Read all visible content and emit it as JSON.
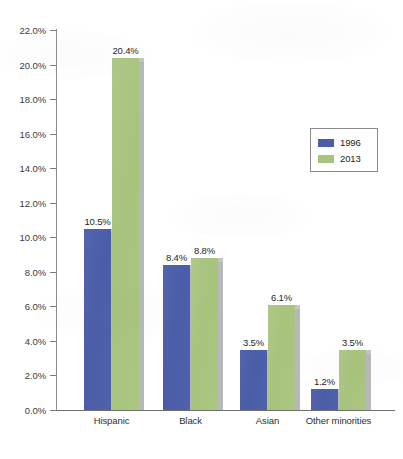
{
  "chart_data": {
    "type": "bar",
    "title": "",
    "subtitle": "",
    "xlabel": "",
    "ylabel": "",
    "categories": [
      "Hispanic",
      "Black",
      "Asian",
      "Other minorities"
    ],
    "series": [
      {
        "name": "1996",
        "color": "#4b5da8",
        "values": [
          10.5,
          8.4,
          3.5,
          1.2
        ],
        "value_labels": [
          "10.5%",
          "8.4%",
          "3.5%",
          "1.2%"
        ]
      },
      {
        "name": "2013",
        "color": "#a7c37c",
        "values": [
          20.4,
          8.8,
          6.1,
          3.5
        ],
        "value_labels": [
          "20.4%",
          "8.8%",
          "6.1%",
          "3.5%"
        ]
      }
    ],
    "ylim": [
      0.0,
      22.0
    ],
    "ytick_step": 2.0,
    "ytick_values": [
      22.0,
      20.0,
      18.0,
      16.0,
      14.0,
      12.0,
      10.0,
      8.0,
      6.0,
      4.0,
      2.0,
      0.0
    ],
    "ytick_labels": [
      "22.0%",
      "20.0%",
      "18.0%",
      "16.0%",
      "14.0%",
      "12.0%",
      "10.0%",
      "8.0%",
      "6.0%",
      "4.0%",
      "2.0%",
      "0.0%"
    ],
    "grid": false,
    "legend_position": "upper-right-inside",
    "value_labels_shown": true
  },
  "legend": {
    "entries": [
      {
        "label": "1996",
        "color": "#4b5da8"
      },
      {
        "label": "2013",
        "color": "#a7c37c"
      }
    ]
  },
  "axis": {
    "y_labels": [
      "22.0%",
      "20.0%",
      "18.0%",
      "16.0%",
      "14.0%",
      "12.0%",
      "10.0%",
      "8.0%",
      "6.0%",
      "4.0%",
      "2.0%",
      "0.0%"
    ],
    "x_labels": [
      "Hispanic",
      "Black",
      "Asian",
      "Other minorities"
    ]
  },
  "colors": {
    "series_1996": "#4b5da8",
    "series_2013": "#a7c37c",
    "bar_shadow": "#b6b9ba",
    "axis": "#7c7c7c",
    "text": "#2b2b2b",
    "background": "#ffffff"
  }
}
